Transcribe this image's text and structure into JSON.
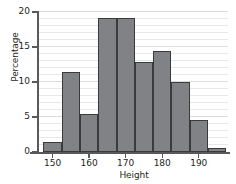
{
  "chart_data": {
    "type": "bar",
    "title": "",
    "xlabel": "Height",
    "ylabel": "Percentage",
    "categories": [
      "147.5-152.5",
      "152.5-157.5",
      "157.5-162.5",
      "162.5-167.5",
      "167.5-172.5",
      "172.5-177.5",
      "177.5-182.5",
      "182.5-187.5",
      "187.5-192.5",
      "192.5-197.5"
    ],
    "bin_edges": [
      147.5,
      152.5,
      157.5,
      162.5,
      167.5,
      172.5,
      177.5,
      182.5,
      187.5,
      192.5,
      197.5
    ],
    "bin_width": 5,
    "values": [
      1.5,
      11.5,
      5.4,
      19.2,
      19.2,
      12.9,
      14.5,
      10.0,
      4.6,
      0.6
    ],
    "xlim": [
      146,
      198
    ],
    "ylim": [
      0,
      20
    ],
    "xticks": [
      150,
      160,
      170,
      180,
      190
    ],
    "xtick_labels": [
      "150",
      "160",
      "170",
      "180",
      "190"
    ],
    "yticks": [
      0,
      5,
      10,
      15,
      20
    ],
    "ytick_labels": [
      "0",
      "5",
      "10",
      "15",
      "20"
    ],
    "grid": true,
    "minor_grid": true,
    "legend": "none",
    "bar_color": "#808285",
    "bar_edge_color": "#3a3a3c",
    "grid_color": "#e8e8e8",
    "axis_color": "#58595b",
    "background": "#ffffff"
  }
}
